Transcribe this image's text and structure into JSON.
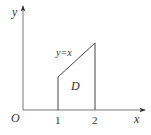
{
  "diagram": {
    "axes": {
      "x_label": "x",
      "y_label": "y",
      "origin_label": "O"
    },
    "ticks": [
      "1",
      "2"
    ],
    "curve_label": "y=x",
    "region_label": "D",
    "colors": {
      "line": "#444444",
      "text": "#333333",
      "background": "#ffffff"
    }
  }
}
